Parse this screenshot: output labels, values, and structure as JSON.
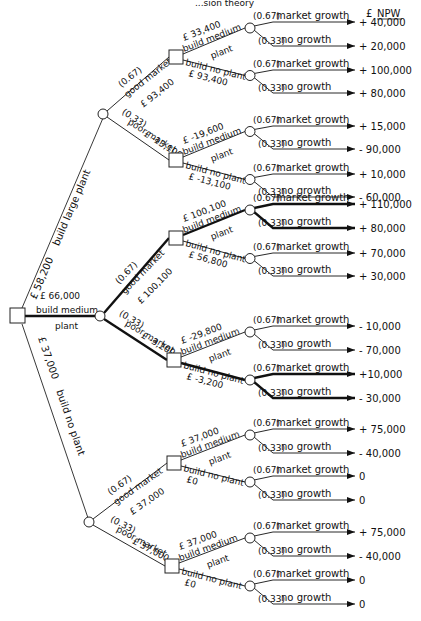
{
  "header": {
    "title_fragment": "...sion theory",
    "npw_currency": "£",
    "npw_label": "NPW"
  },
  "root": {
    "type": "decision",
    "options": [
      {
        "label": "build large plant",
        "value": "£ 58,200",
        "bold": false
      },
      {
        "label": "build medium plant",
        "value": "£ 66,000",
        "bold": true
      },
      {
        "label": "build no plant",
        "value": "£ 37,000",
        "bold": false
      }
    ]
  },
  "branches": [
    {
      "name": "large",
      "outcomes": [
        {
          "prob": "(0.67)",
          "label": "good market",
          "value": "£ 93,400",
          "decision": {
            "medium": {
              "value": "£ 33,400",
              "label1": "build medium",
              "label2": "plant"
            },
            "noplant": {
              "value": "£ 93,400",
              "label": "build no plant"
            },
            "leaves": [
              {
                "prob": "(0.67)",
                "label": "market growth",
                "npw": "+ 40,000"
              },
              {
                "prob": "(0.33)",
                "label": "no growth",
                "npw": "+ 20,000"
              },
              {
                "prob": "(0.67)",
                "label": "market growth",
                "npw": "+ 100,000"
              },
              {
                "prob": "(0.33)",
                "label": "no growth",
                "npw": "+ 80,000"
              }
            ]
          }
        },
        {
          "prob": "(0.33)",
          "label": "poor market",
          "value": "£ -13,100",
          "decision": {
            "medium": {
              "value": "£ -19,600",
              "label1": "build medium",
              "label2": "plant"
            },
            "noplant": {
              "value": "£ -13,100",
              "label": "build no plant"
            },
            "leaves": [
              {
                "prob": "(0.67)",
                "label": "market growth",
                "npw": "+ 15,000"
              },
              {
                "prob": "(0.33)",
                "label": "no growth",
                "npw": "- 90,000"
              },
              {
                "prob": "(0.67)",
                "label": "market growth",
                "npw": "+ 10,000"
              },
              {
                "prob": "(0.33)",
                "label": "no growth",
                "npw": "- 60,000"
              }
            ]
          }
        }
      ]
    },
    {
      "name": "medium",
      "outcomes": [
        {
          "prob": "(0.67)",
          "label": "good market",
          "value": "£ 100,100",
          "decision": {
            "medium": {
              "value": "£ 100,100",
              "label1": "build medium",
              "label2": "plant"
            },
            "noplant": {
              "value": "£ 56,800",
              "label": "build no plant"
            },
            "leaves": [
              {
                "prob": "(0.67)",
                "label": "market growth",
                "npw": "+ 110,000"
              },
              {
                "prob": "(0.33)",
                "label": "no growth",
                "npw": "+ 80,000"
              },
              {
                "prob": "(0.67)",
                "label": "market growth",
                "npw": "+ 70,000"
              },
              {
                "prob": "(0.33)",
                "label": "no growth",
                "npw": "+ 30,000"
              }
            ]
          }
        },
        {
          "prob": "(0.33)",
          "label": "poor market",
          "value": "£ -3,200",
          "decision": {
            "medium": {
              "value": "£ -29,800",
              "label1": "build medium",
              "label2": "plant"
            },
            "noplant": {
              "value": "£ -3,200",
              "label": "build no plant"
            },
            "leaves": [
              {
                "prob": "(0.67)",
                "label": "market growth",
                "npw": "- 10,000"
              },
              {
                "prob": "(0.33)",
                "label": "no growth",
                "npw": "- 70,000"
              },
              {
                "prob": "(0.67)",
                "label": "market growth",
                "npw": "+10,000"
              },
              {
                "prob": "(0.33)",
                "label": "no growth",
                "npw": "- 30,000"
              }
            ]
          }
        }
      ]
    },
    {
      "name": "noplant",
      "outcomes": [
        {
          "prob": "(0.67)",
          "label": "good market",
          "value": "£ 37,000",
          "decision": {
            "medium": {
              "value": "£ 37,000",
              "label1": "build medium",
              "label2": "plant"
            },
            "noplant": {
              "value": "£0",
              "label": "build no plant"
            },
            "leaves": [
              {
                "prob": "(0.67)",
                "label": "market growth",
                "npw": "+ 75,000"
              },
              {
                "prob": "(0.33)",
                "label": "no growth",
                "npw": "- 40,000"
              },
              {
                "prob": "(0.67)",
                "label": "market growth",
                "npw": "0"
              },
              {
                "prob": "(0.33)",
                "label": "no growth",
                "npw": "0"
              }
            ]
          }
        },
        {
          "prob": "(0.33)",
          "label": "poor market",
          "value": "£ 37,000",
          "decision": {
            "medium": {
              "value": "£ 37,000",
              "label1": "build medium",
              "label2": "plant"
            },
            "noplant": {
              "value": "£0",
              "label": "build no plant"
            },
            "leaves": [
              {
                "prob": "(0.67)",
                "label": "market growth",
                "npw": "+ 75,000"
              },
              {
                "prob": "(0.33)",
                "label": "no growth",
                "npw": "- 40,000"
              },
              {
                "prob": "(0.67)",
                "label": "market growth",
                "npw": "0"
              },
              {
                "prob": "(0.33)",
                "label": "no growth",
                "npw": "0"
              }
            ]
          }
        }
      ]
    }
  ]
}
